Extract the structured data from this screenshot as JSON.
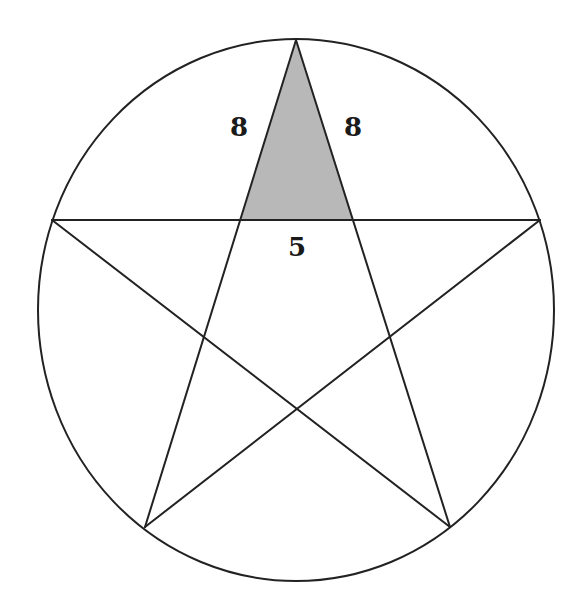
{
  "figure": {
    "type": "pentagram inscribed in circle",
    "circle": {
      "cx": 296,
      "cy": 310,
      "rx": 258,
      "ry": 271
    },
    "vertices": {
      "top": [
        296,
        40
      ],
      "left": [
        52,
        220
      ],
      "right": [
        540,
        220
      ],
      "bottom_left": [
        145,
        527
      ],
      "bottom_right": [
        450,
        527
      ]
    },
    "shaded_triangle": {
      "points": [
        [
          296,
          40
        ],
        [
          241,
          220
        ],
        [
          353,
          220
        ]
      ],
      "fill": "#b8b8b8"
    },
    "stroke_color": "#222222",
    "labels": {
      "left_side": "8",
      "right_side": "8",
      "base": "5"
    }
  }
}
